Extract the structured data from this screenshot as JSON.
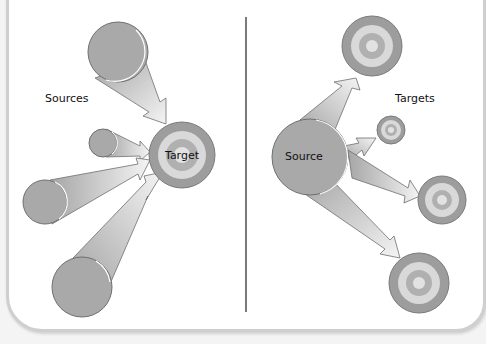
{
  "left_panel": {
    "group_label": "Sources",
    "target_label": "Target",
    "target": {
      "cx": 182,
      "cy": 155,
      "r": 33
    },
    "sources": [
      {
        "cx": 118,
        "cy": 52,
        "r": 30
      },
      {
        "cx": 103,
        "cy": 143,
        "r": 14
      },
      {
        "cx": 45,
        "cy": 202,
        "r": 22
      },
      {
        "cx": 82,
        "cy": 287,
        "r": 30
      }
    ]
  },
  "right_panel": {
    "group_label": "Targets",
    "source_label": "Source",
    "source": {
      "cx": 310,
      "cy": 157,
      "r": 38
    },
    "targets": [
      {
        "cx": 372,
        "cy": 46,
        "r": 30
      },
      {
        "cx": 391,
        "cy": 130,
        "r": 14
      },
      {
        "cx": 442,
        "cy": 200,
        "r": 24
      },
      {
        "cx": 419,
        "cy": 283,
        "r": 30
      }
    ]
  },
  "colors": {
    "circle_fill": "#a9a9a9",
    "circle_stroke": "#6f6f6f",
    "ring_outer": "#9d9d9d",
    "ring_light": "#d9d9d9",
    "ring_mid": "#b0b0b0",
    "ring_center": "#e2e2e2",
    "arrow_dark": "#a8a8a8",
    "arrow_light": "#f2f2f2",
    "divider": "#222222"
  }
}
